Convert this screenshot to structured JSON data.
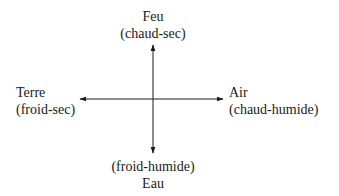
{
  "diagram": {
    "type": "four-elements-cross",
    "colors": {
      "background": "#ffffff",
      "ink": "#1a1a1a"
    },
    "axes": {
      "center": [
        153,
        99
      ],
      "up_tip": [
        153,
        45
      ],
      "down_tip": [
        153,
        153
      ],
      "left_tip": [
        80,
        99
      ],
      "right_tip": [
        223,
        99
      ]
    },
    "elements": {
      "top": {
        "name": "Feu",
        "qualities": "(chaud-sec)"
      },
      "left": {
        "name": "Terre",
        "qualities": "(froid-sec)"
      },
      "right": {
        "name": "Air",
        "qualities": "(chaud-humide)"
      },
      "bottom": {
        "name": "Eau",
        "qualities": "(froid-humide)"
      }
    }
  }
}
